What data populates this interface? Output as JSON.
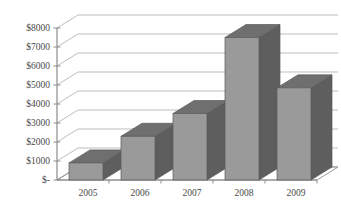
{
  "chart_data": {
    "type": "bar",
    "title": "",
    "subtitle": "",
    "xlabel": "",
    "ylabel": "",
    "categories": [
      "2005",
      "2006",
      "2007",
      "2008",
      "2009"
    ],
    "values": [
      900,
      2300,
      3500,
      7500,
      4850
    ],
    "series": [
      {
        "name": "",
        "values": [
          900,
          2300,
          3500,
          7500,
          4850
        ]
      }
    ],
    "ylim": [
      0,
      8000
    ],
    "ytick_values": [
      0,
      1000,
      2000,
      3000,
      4000,
      5000,
      6000,
      7000,
      8000
    ],
    "ytick_labels": [
      "$-",
      "$1000",
      "$2000",
      "$3000",
      "$4000",
      "$5000",
      "$6000",
      "$7000",
      "$8000"
    ],
    "grid": true,
    "grid_axis": "y",
    "legend": false,
    "legend_position": "none",
    "three_d": true,
    "annotations": []
  },
  "style": {
    "background": "#ffffff",
    "bar_front": "#9a9a9a",
    "bar_top": "#6f6f6f",
    "bar_side": "#5e5e5e",
    "bar_outline": "#5a5a5a",
    "axis_line": "#8a8a8a",
    "grid_line": "#b5b5b5",
    "floor_line": "#9a9a9a",
    "tick_text": "#4a4a4a"
  },
  "geometry": {
    "plot_left": 57,
    "plot_bottom": 180,
    "plot_top": 28,
    "plot_right": 317,
    "depth_dx": 21,
    "depth_dy": -13,
    "bar_width": 34,
    "bar_slot": 52,
    "px_per_1000": 19
  }
}
